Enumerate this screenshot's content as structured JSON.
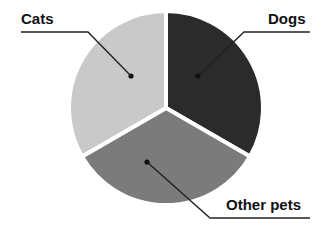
{
  "chart_data": {
    "type": "pie",
    "title": "",
    "categories": [
      "Dogs",
      "Other pets",
      "Cats"
    ],
    "values": [
      33.3,
      33.3,
      33.3
    ],
    "colors": [
      "#2b2b2b",
      "#7b7b7b",
      "#c9c9c9"
    ],
    "legend": "none",
    "start_angle_deg": 0,
    "direction": "clockwise",
    "annotations": [
      {
        "label": "Cats",
        "position": "top-left"
      },
      {
        "label": "Dogs",
        "position": "top-right"
      },
      {
        "label": "Other pets",
        "position": "bottom-right"
      }
    ]
  },
  "labels": {
    "cats": "Cats",
    "dogs": "Dogs",
    "other": "Other pets"
  }
}
